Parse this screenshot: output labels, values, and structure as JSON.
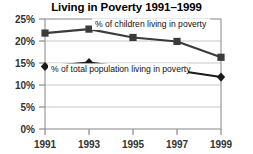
{
  "chart_data": {
    "type": "line",
    "title": "Living in Poverty 1991–1999",
    "xlabel": "",
    "ylabel": "",
    "categories": [
      "1991",
      "1993",
      "1995",
      "1997",
      "1999"
    ],
    "x": [
      1991,
      1993,
      1995,
      1997,
      1999
    ],
    "xlim": [
      1991,
      1999
    ],
    "ylim": [
      0,
      25
    ],
    "yticks": [
      0,
      5,
      10,
      15,
      20,
      25
    ],
    "ytick_labels": [
      "0%",
      "5%",
      "10%",
      "15%",
      "20%",
      "25%"
    ],
    "xtick_labels": [
      "1991",
      "1993",
      "1995",
      "1997",
      "1999"
    ],
    "grid": "horizontal",
    "legend_position": "inline-annotation",
    "series": [
      {
        "name": "% of children living in poverty",
        "marker": "square",
        "color": "#3b3b3b",
        "values": [
          21.8,
          22.7,
          20.8,
          19.9,
          16.3
        ]
      },
      {
        "name": "% of total population living in poverty",
        "marker": "diamond",
        "color": "#1a1a1a",
        "values": [
          14.2,
          15.1,
          13.8,
          13.3,
          11.8
        ]
      }
    ],
    "annotations": [
      "% of children living in poverty",
      "% of total population living in poverty"
    ]
  },
  "colors": {
    "plot_frame": "#9a9a9a",
    "gridline": "#c9c9c9",
    "tick": "#8a8a8a",
    "title": "#000000",
    "background": "#ffffff"
  }
}
